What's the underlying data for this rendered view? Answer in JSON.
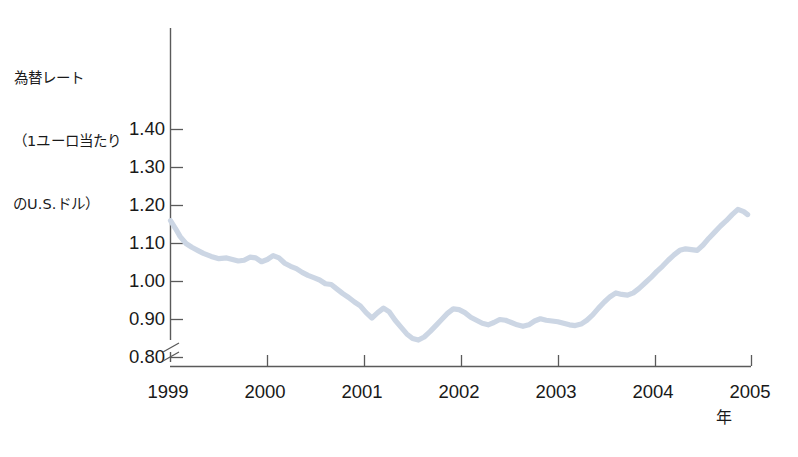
{
  "chart_data": {
    "type": "line",
    "title": "為替レート\n（1ユーロ当たり\nのU.S.ドル）",
    "title_lines": [
      "為替レート",
      "（1ユーロ当たり",
      "のU.S.ドル）"
    ],
    "xlabel": "年",
    "ylabel": "為替レート（1ユーロ当たりのU.S.ドル）",
    "xlim": [
      1999,
      2005
    ],
    "ylim": [
      0.8,
      1.42
    ],
    "grid": false,
    "legend": null,
    "axis_break": true,
    "series_color": "#ccd6e4",
    "xticks": [
      {
        "value": 1999,
        "label": "1999"
      },
      {
        "value": 2000,
        "label": "2000"
      },
      {
        "value": 2001,
        "label": "2001"
      },
      {
        "value": 2002,
        "label": "2002"
      },
      {
        "value": 2003,
        "label": "2003"
      },
      {
        "value": 2004,
        "label": "2004"
      },
      {
        "value": 2005,
        "label": "2005"
      }
    ],
    "yticks": [
      {
        "value": 0.8,
        "label": "0.80"
      },
      {
        "value": 0.9,
        "label": "0.90"
      },
      {
        "value": 1.0,
        "label": "1.00"
      },
      {
        "value": 1.1,
        "label": "1.10"
      },
      {
        "value": 1.2,
        "label": "1.20"
      },
      {
        "value": 1.3,
        "label": "1.30"
      },
      {
        "value": 1.4,
        "label": "1.40"
      }
    ],
    "series": [
      {
        "name": "USD per EUR",
        "x": [
          1999.0,
          1999.05,
          1999.1,
          1999.16,
          1999.22,
          1999.28,
          1999.34,
          1999.42,
          1999.5,
          1999.58,
          1999.64,
          1999.7,
          1999.76,
          1999.82,
          1999.88,
          1999.94,
          2000.0,
          2000.06,
          2000.12,
          2000.18,
          2000.24,
          2000.3,
          2000.36,
          2000.42,
          2000.48,
          2000.54,
          2000.6,
          2000.66,
          2000.72,
          2000.78,
          2000.84,
          2000.9,
          2000.96,
          2001.02,
          2001.08,
          2001.14,
          2001.2,
          2001.26,
          2001.32,
          2001.38,
          2001.44,
          2001.5,
          2001.56,
          2001.62,
          2001.68,
          2001.74,
          2001.8,
          2001.86,
          2001.92,
          2001.98,
          2002.04,
          2002.1,
          2002.16,
          2002.22,
          2002.28,
          2002.34,
          2002.4,
          2002.46,
          2002.52,
          2002.58,
          2002.64,
          2002.7,
          2002.76,
          2002.82,
          2002.88,
          2002.94,
          2003.0,
          2003.06,
          2003.12,
          2003.18,
          2003.24,
          2003.3,
          2003.36,
          2003.42,
          2003.48,
          2003.54,
          2003.6,
          2003.66,
          2003.72,
          2003.78,
          2003.84,
          2003.9,
          2003.96,
          2004.02,
          2004.08,
          2004.14,
          2004.2,
          2004.26,
          2004.32,
          2004.38,
          2004.44,
          2004.5,
          2004.56,
          2004.62,
          2004.68,
          2004.74,
          2004.8,
          2004.86,
          2004.92,
          2004.96
        ],
        "y": [
          1.16,
          1.14,
          1.118,
          1.1,
          1.09,
          1.082,
          1.074,
          1.066,
          1.06,
          1.062,
          1.058,
          1.054,
          1.056,
          1.064,
          1.062,
          1.052,
          1.058,
          1.068,
          1.062,
          1.048,
          1.04,
          1.034,
          1.024,
          1.016,
          1.01,
          1.004,
          0.994,
          0.992,
          0.98,
          0.968,
          0.958,
          0.946,
          0.936,
          0.918,
          0.904,
          0.918,
          0.93,
          0.92,
          0.898,
          0.88,
          0.862,
          0.85,
          0.846,
          0.854,
          0.868,
          0.884,
          0.9,
          0.916,
          0.928,
          0.926,
          0.918,
          0.906,
          0.898,
          0.89,
          0.886,
          0.892,
          0.9,
          0.898,
          0.892,
          0.886,
          0.882,
          0.886,
          0.896,
          0.902,
          0.898,
          0.896,
          0.894,
          0.89,
          0.886,
          0.884,
          0.888,
          0.898,
          0.912,
          0.93,
          0.946,
          0.96,
          0.97,
          0.966,
          0.964,
          0.97,
          0.982,
          0.996,
          1.01,
          1.026,
          1.04,
          1.056,
          1.07,
          1.082,
          1.086,
          1.084,
          1.082,
          1.096,
          1.114,
          1.13,
          1.146,
          1.16,
          1.176,
          1.19,
          1.184,
          1.176
        ]
      }
    ],
    "annotations": [],
    "series_notes": {
      "start_value": 1.16,
      "start_year": 1999,
      "min_value": 0.845,
      "min_year_approx": 2000.8,
      "max_value": 1.36,
      "max_year_approx": 2004.85,
      "end_value": 1.32,
      "end_year_approx": 2005
    }
  }
}
